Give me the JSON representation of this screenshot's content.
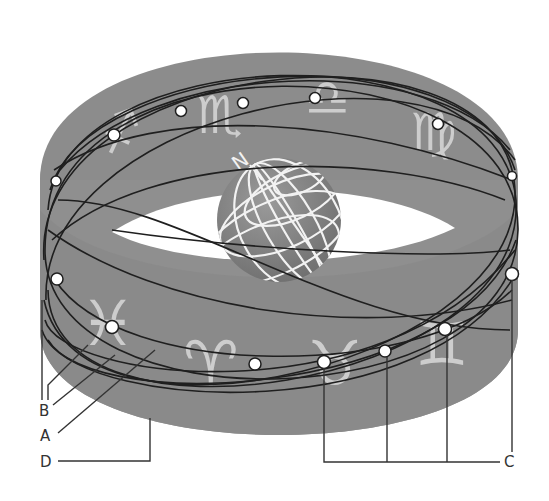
{
  "diagram": {
    "colors": {
      "band": "#8f8f8f",
      "band_dark": "#7e7e7e",
      "band_inner": "#999999",
      "globe": "#858585",
      "globe_grid": "#f2f2f2",
      "orbit_line": "#1f1f1f",
      "dot_fill": "#ffffff",
      "zodiac_glyph": "#d9d9d9",
      "leader_line": "#333333",
      "background": "#ffffff"
    },
    "earth": {
      "pole_label": "N"
    },
    "zodiac_signs": [
      {
        "name": "Sagittarius",
        "glyph": "♐",
        "position": "back-left"
      },
      {
        "name": "Scorpio",
        "glyph": "♏",
        "position": "back"
      },
      {
        "name": "Libra",
        "glyph": "♎",
        "position": "back"
      },
      {
        "name": "Virgo",
        "glyph": "♍",
        "position": "back-right"
      },
      {
        "name": "Pisces",
        "glyph": "♓",
        "position": "front-left"
      },
      {
        "name": "Aries",
        "glyph": "♈",
        "position": "front"
      },
      {
        "name": "Taurus",
        "glyph": "♉",
        "position": "front"
      },
      {
        "name": "Gemini",
        "glyph": "♊",
        "position": "front-right"
      }
    ],
    "labels": {
      "A": "A",
      "B": "B",
      "C": "C",
      "D": "D"
    }
  }
}
